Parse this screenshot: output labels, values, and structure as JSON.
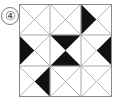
{
  "figure": {
    "label": "④",
    "label_icon": "circled-number-four",
    "width": 119,
    "height": 104,
    "background_color": "#ffffff"
  },
  "grid": {
    "rows": 3,
    "cols": 3,
    "cell_size": 31,
    "origin_x": 19,
    "origin_y": 4,
    "outer_border_color": "#8a8a8a",
    "inner_line_color": "#a8a8a8",
    "diagonal_line_color": "#b4b4b4",
    "fill_color": "#111111",
    "empty_color": "#ffffff",
    "outer_border_width": 1,
    "inner_line_width": 1,
    "diagonal_line_width": 1
  },
  "chart_data": {
    "type": "heatmap",
    "title": "",
    "subtitle": "",
    "xlabel": "",
    "ylabel": "",
    "categories": [
      "col0",
      "col1",
      "col2"
    ],
    "row_labels": [
      "row0",
      "row1",
      "row2"
    ],
    "triangle_names": [
      "top",
      "right",
      "bottom",
      "left"
    ],
    "cells": [
      {
        "row": 0,
        "col": 0,
        "filled": []
      },
      {
        "row": 0,
        "col": 1,
        "filled": []
      },
      {
        "row": 0,
        "col": 2,
        "filled": [
          "left"
        ]
      },
      {
        "row": 1,
        "col": 0,
        "filled": [
          "left"
        ]
      },
      {
        "row": 1,
        "col": 1,
        "filled": [
          "top",
          "bottom"
        ]
      },
      {
        "row": 1,
        "col": 2,
        "filled": [
          "right"
        ]
      },
      {
        "row": 2,
        "col": 0,
        "filled": [
          "right"
        ]
      },
      {
        "row": 2,
        "col": 1,
        "filled": []
      },
      {
        "row": 2,
        "col": 2,
        "filled": []
      }
    ],
    "values": [
      [
        0,
        0,
        1
      ],
      [
        1,
        2,
        1
      ],
      [
        1,
        0,
        0
      ]
    ],
    "filled_triangle_count": 6,
    "total_triangle_count": 36,
    "legend": [
      {
        "name": "shaded",
        "color": "#111111"
      },
      {
        "name": "unshaded",
        "color": "#ffffff"
      }
    ]
  }
}
